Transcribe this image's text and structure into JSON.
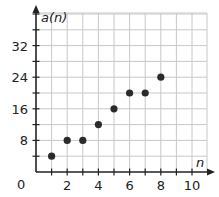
{
  "chart_data": {
    "type": "scatter",
    "title": "",
    "xlabel": "n",
    "ylabel": "a(n)",
    "origin_label": "0",
    "xlim": [
      0,
      10.8
    ],
    "ylim": [
      0,
      40
    ],
    "grid": true,
    "x_grid_step": 1,
    "y_grid_step": 4,
    "x_tick_labels": [
      "2",
      "4",
      "6",
      "8",
      "10"
    ],
    "x_tick_values": [
      2,
      4,
      6,
      8,
      10
    ],
    "y_tick_labels": [
      "8",
      "16",
      "24",
      "32"
    ],
    "y_tick_values": [
      8,
      16,
      24,
      32
    ],
    "points": [
      {
        "x": 1,
        "y": 4
      },
      {
        "x": 2,
        "y": 8
      },
      {
        "x": 3,
        "y": 8
      },
      {
        "x": 4,
        "y": 12
      },
      {
        "x": 5,
        "y": 16
      },
      {
        "x": 6,
        "y": 20
      },
      {
        "x": 7,
        "y": 20
      },
      {
        "x": 8,
        "y": 24
      }
    ],
    "colors": {
      "grid": "#c8c8c8",
      "axis": "#222222",
      "point": "#2b2b2b"
    }
  }
}
